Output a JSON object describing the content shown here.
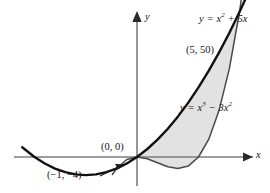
{
  "figure": {
    "background": "#ffffff",
    "curve_color": "#111111",
    "axis_color": "#808080",
    "shade_color": "#e2e2e2"
  },
  "axes": {
    "x_label": "x",
    "y_label": "y",
    "origin_px": {
      "x": 137,
      "y": 157
    },
    "x_scale_px_per_unit": 20.5,
    "y_scale_px_per_unit": 2.9,
    "has_tick_labels": false,
    "has_grid": false,
    "arrowheads": [
      "x-positive",
      "y-positive"
    ]
  },
  "labels": {
    "curve_quadratic": "y = x",
    "curve_quadratic_exp": "2",
    "curve_quadratic_tail": " + 5x",
    "curve_cubic": "y = x",
    "curve_cubic_exp": "3",
    "curve_cubic_mid": " − 3x",
    "curve_cubic_exp2": "2",
    "point_intersection_upper": "(5, 50)",
    "point_origin": "(0, 0)",
    "point_vertex": "(−1, −4)"
  },
  "chart_data": {
    "type": "line",
    "title": "",
    "xlabel": "x",
    "ylabel": "y",
    "xlim": [
      -6.7,
      6.5
    ],
    "ylim": [
      -55,
      62
    ],
    "grid": false,
    "legend": "inline-annotations",
    "series": [
      {
        "name": "y = x² + 5x",
        "equation": "y = x^2 + 5*x",
        "color": "#111111",
        "x": [
          -5.6,
          -5.0,
          -4.5,
          -4.0,
          -3.5,
          -3.0,
          -2.5,
          -2.0,
          -1.5,
          -1.0,
          -0.5,
          0.0,
          0.5,
          1.0,
          1.5,
          2.0,
          2.5,
          3.0,
          3.5,
          4.0,
          4.5,
          5.0,
          5.4
        ],
        "y": [
          3.36,
          0.0,
          -2.25,
          -4.0,
          -5.25,
          -6.0,
          -6.25,
          -6.0,
          -5.25,
          -4.0,
          -2.25,
          0.0,
          2.75,
          6.0,
          9.75,
          14.0,
          18.75,
          24.0,
          29.75,
          36.0,
          42.75,
          50.0,
          56.16
        ]
      },
      {
        "name": "y = x³ − 3x²",
        "equation": "y = x^3 - 3*x^2",
        "color": "#555555",
        "x": [
          -1.2,
          -1.0,
          -0.5,
          0.0,
          0.5,
          1.0,
          1.5,
          2.0,
          2.5,
          3.0,
          3.5,
          4.0,
          4.5,
          5.0,
          5.3
        ],
        "y": [
          -6.05,
          -4.0,
          -0.875,
          0.0,
          -0.625,
          -2.0,
          -3.375,
          -4.0,
          -3.125,
          0.0,
          6.125,
          16.0,
          30.375,
          50.0,
          64.58
        ]
      }
    ],
    "annotations": [
      {
        "text": "(5, 50)",
        "x": 5,
        "y": 50,
        "note": "upper intersection of the two curves"
      },
      {
        "text": "(0, 0)",
        "x": 0,
        "y": 0,
        "note": "lower intersection at the origin"
      },
      {
        "text": "(−1, −4)",
        "x": -1,
        "y": -4,
        "note": "left intersection of the two curves"
      }
    ],
    "shaded_regions": [
      {
        "between": [
          "y = x² + 5x",
          "y = x³ − 3x²"
        ],
        "x_from": 0,
        "x_to": 5,
        "fill": "#e2e2e2",
        "note": "region enclosed between the curves from x = 0 to x = 5"
      }
    ]
  }
}
